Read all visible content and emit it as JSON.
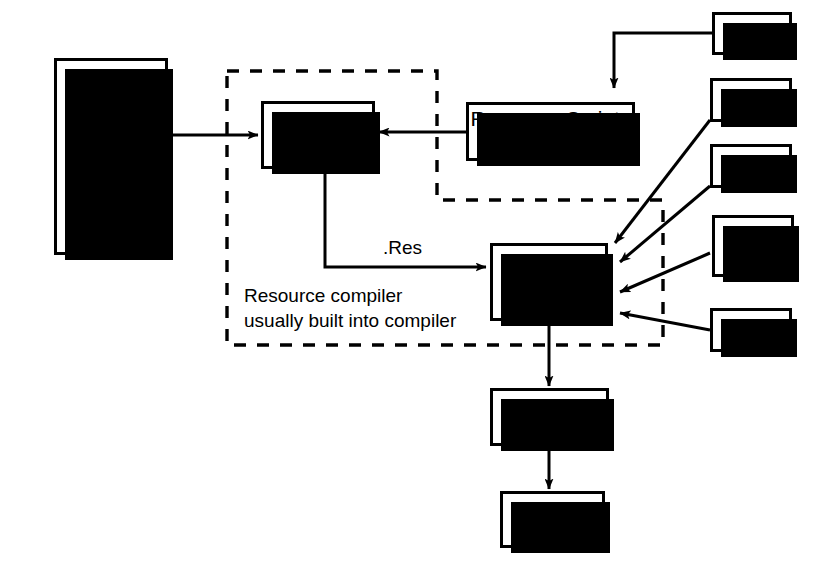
{
  "diagram": {
    "colors": {
      "ink": "#000000",
      "paper": "#ffffff"
    },
    "nodes": {
      "resources": {
        "title": "Resources",
        "items": [
          "BMP",
          "ICO",
          "CUR",
          "WAV"
        ],
        "ellipsis_dots": 3
      },
      "resource_compiler": {
        "label": "Resource\nCompiler"
      },
      "resource_scripts": {
        "label": "Resource Scripts\n.RC"
      },
      "c_compiler": {
        "label": "C/C++\nCompiler"
      },
      "linker": {
        "label": "Linker"
      },
      "exe": {
        "label": ".EXE"
      },
      "h_top": {
        "label": ".h"
      },
      "lib": {
        "label": ".Lib"
      },
      "objs": {
        "label": ".Objs"
      },
      "c_cpp": {
        "label": ".c\n.cpp"
      },
      "h_bottom": {
        "label": ".h"
      }
    },
    "labels": {
      "res_edge": ".Res",
      "dashed_group_note": "Resource compiler\nusually built into compiler"
    }
  }
}
